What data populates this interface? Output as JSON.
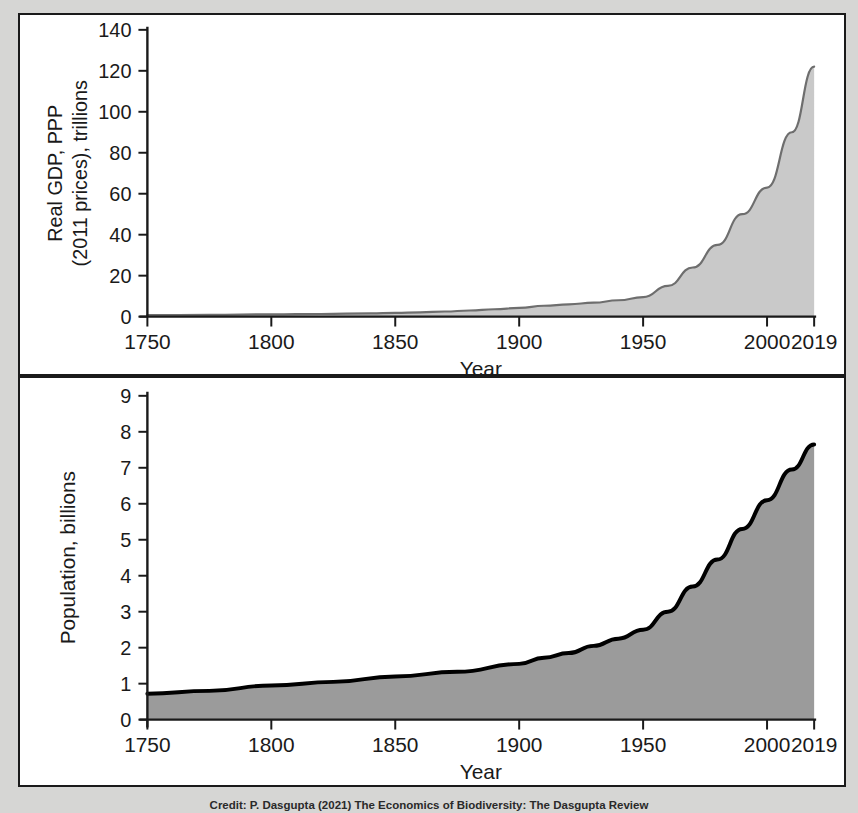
{
  "figure": {
    "background_color": "#d6d6d4",
    "panel_background": "#ffffff",
    "panel_border_color": "#1a1a1a",
    "caption": "Credit: P. Dasgupta (2021) The Economics of Biodiversity: The Dasgupta Review"
  },
  "chart_data": [
    {
      "type": "area",
      "id": "gdp",
      "title": "",
      "xlabel": "Year",
      "ylabel": "Real GDP, PPP\n(2011 prices), trillions",
      "ylabel_line1": "Real GDP, PPP",
      "ylabel_line2": "(2011 prices), trillions",
      "xlim": [
        1750,
        2019
      ],
      "ylim": [
        0,
        140
      ],
      "xticks": [
        1750,
        1800,
        1850,
        1900,
        1950,
        2000,
        2019
      ],
      "xticklabels": [
        "1750",
        "1800",
        "1850",
        "1900",
        "1950",
        "2000",
        "2019"
      ],
      "yticks": [
        0,
        20,
        40,
        60,
        80,
        100,
        120,
        140
      ],
      "yticklabels": [
        "0",
        "20",
        "40",
        "60",
        "80",
        "100",
        "120",
        "140"
      ],
      "grid": false,
      "legend": false,
      "fill_color": "#c9c9c9",
      "line_color": "#6e6e6e",
      "line_width": 2.2,
      "x": [
        1750,
        1775,
        1800,
        1820,
        1840,
        1850,
        1860,
        1870,
        1880,
        1890,
        1900,
        1910,
        1920,
        1930,
        1940,
        1950,
        1960,
        1970,
        1980,
        1990,
        2000,
        2010,
        2019
      ],
      "values": [
        0.7,
        0.9,
        1.1,
        1.3,
        1.6,
        1.8,
        2.1,
        2.5,
        3.0,
        3.6,
        4.3,
        5.3,
        6.0,
        6.8,
        8.0,
        9.5,
        15.0,
        24.0,
        35.0,
        50.0,
        63.0,
        90.0,
        122.0
      ]
    },
    {
      "type": "area",
      "id": "population",
      "title": "",
      "xlabel": "Year",
      "ylabel": "Population, billions",
      "xlim": [
        1750,
        2019
      ],
      "ylim": [
        0,
        9
      ],
      "xticks": [
        1750,
        1800,
        1850,
        1900,
        1950,
        2000,
        2019
      ],
      "xticklabels": [
        "1750",
        "1800",
        "1850",
        "1900",
        "1950",
        "2000",
        "2019"
      ],
      "yticks": [
        0,
        1,
        2,
        3,
        4,
        5,
        6,
        7,
        8,
        9
      ],
      "yticklabels": [
        "0",
        "1",
        "2",
        "3",
        "4",
        "5",
        "6",
        "7",
        "8",
        "9"
      ],
      "grid": false,
      "legend": false,
      "fill_color": "#9b9b9b",
      "line_color": "#000000",
      "line_width": 4.0,
      "x": [
        1750,
        1775,
        1800,
        1825,
        1850,
        1875,
        1900,
        1910,
        1920,
        1930,
        1940,
        1950,
        1960,
        1970,
        1980,
        1990,
        2000,
        2010,
        2019
      ],
      "values": [
        0.72,
        0.8,
        0.95,
        1.05,
        1.2,
        1.33,
        1.55,
        1.72,
        1.85,
        2.05,
        2.25,
        2.5,
        3.0,
        3.7,
        4.45,
        5.3,
        6.1,
        6.95,
        7.65
      ]
    }
  ]
}
